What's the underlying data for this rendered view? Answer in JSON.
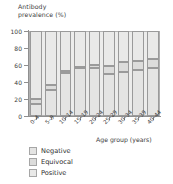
{
  "chart_data": {
    "type": "bar",
    "subtype": "stacked-bar-100",
    "title": "",
    "ylabel": "Antibody\nprevalence (%)",
    "xlabel": "Age group (years)",
    "ylim": [
      0,
      100
    ],
    "yticks": [
      0,
      20,
      40,
      60,
      80,
      100
    ],
    "ytick_labels": [
      "0",
      "20",
      "40",
      "60",
      "80",
      "100"
    ],
    "grid": false,
    "legend_position": "below-left",
    "categories": [
      "0–4",
      "5–9",
      "10–14",
      "15–19",
      "20–24",
      "25–29",
      "30–34",
      "35–39",
      "40–44"
    ],
    "series": [
      {
        "name": "Negative",
        "color": "#e4e4e3",
        "values": [
          14,
          31,
          51,
          56,
          57,
          49,
          52,
          54,
          57
        ]
      },
      {
        "name": "Equivocal",
        "color": "#dcdcdb",
        "values": [
          6,
          5,
          2,
          2,
          3,
          10,
          11,
          11,
          10
        ]
      },
      {
        "name": "Positive",
        "color": "#e9e9e8",
        "values": [
          80,
          64,
          47,
          42,
          40,
          41,
          37,
          35,
          33
        ]
      }
    ],
    "cumulative_boundaries": [
      [
        14,
        20
      ],
      [
        31,
        36
      ],
      [
        51,
        53
      ],
      [
        56,
        58
      ],
      [
        57,
        60
      ],
      [
        49,
        59
      ],
      [
        52,
        63
      ],
      [
        54,
        65
      ],
      [
        57,
        67
      ]
    ]
  },
  "legend": {
    "items": [
      {
        "label": "Negative",
        "color": "#e4e4e3"
      },
      {
        "label": "Equivocal",
        "color": "#dcdcdb"
      },
      {
        "label": "Positive",
        "color": "#e9e9e8"
      }
    ]
  }
}
